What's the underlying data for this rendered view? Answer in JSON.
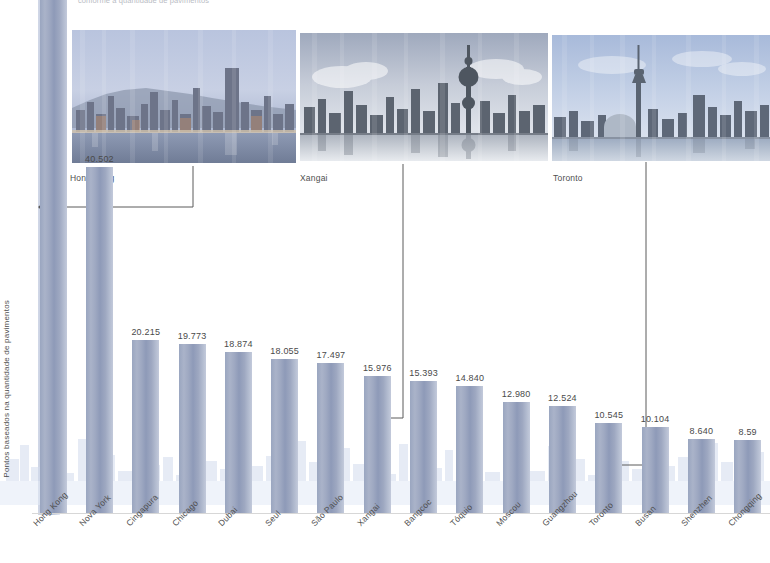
{
  "deck": {
    "text": "conforme a quantidade de pavimentos"
  },
  "photos": [
    {
      "name": "hong-kong-skyline",
      "caption": "Hong Kong"
    },
    {
      "name": "shanghai-skyline",
      "caption": "Xangai"
    },
    {
      "name": "toronto-skyline",
      "caption": "Toronto"
    }
  ],
  "axis": {
    "ylabel": "Pontos baseados na quantidade de pavimentos"
  },
  "colors": {
    "bar": "#9aa6c0",
    "bar_light": "#c3cadb",
    "text": "#4a4a4a",
    "watermark": "#cfd9ec",
    "leader": "#5a5a5a"
  },
  "chart_data": {
    "type": "bar",
    "title": "",
    "xlabel": "",
    "ylabel": "Pontos baseados na quantidade de pavimentos",
    "ylim": [
      0,
      44000
    ],
    "grid": false,
    "legend": null,
    "note": "A barra de Hong Kong extrapola o topo da imagem e nao exibe rotulo visivel; o rotulo da ultima barra (Chongqing) esta cortado na borda direita.",
    "categories": [
      "Hong Kong",
      "Nova York",
      "Cingapura",
      "Chicago",
      "Dubai",
      "Seul",
      "São Paulo",
      "Xangai",
      "Bangcoc",
      "Tóquio",
      "Moscou",
      "Guangzhou",
      "Toronto",
      "Busan",
      "Shenzhen",
      "Chongqing"
    ],
    "values": [
      null,
      40502,
      20215,
      19773,
      18874,
      18055,
      17497,
      15976,
      15393,
      14840,
      12980,
      12524,
      10545,
      10104,
      8640,
      8590
    ],
    "value_labels": [
      "",
      "40.502",
      "20.215",
      "19.773",
      "18.874",
      "18.055",
      "17.497",
      "15.976",
      "15.393",
      "14.840",
      "12.980",
      "12.524",
      "10.545",
      "10.104",
      "8.640",
      "8.59"
    ],
    "callouts": [
      {
        "category": "Hong Kong",
        "label": "Hong Kong"
      },
      {
        "category": "Xangai",
        "label": "Xangai"
      },
      {
        "category": "Toronto",
        "label": "Toronto"
      }
    ]
  }
}
